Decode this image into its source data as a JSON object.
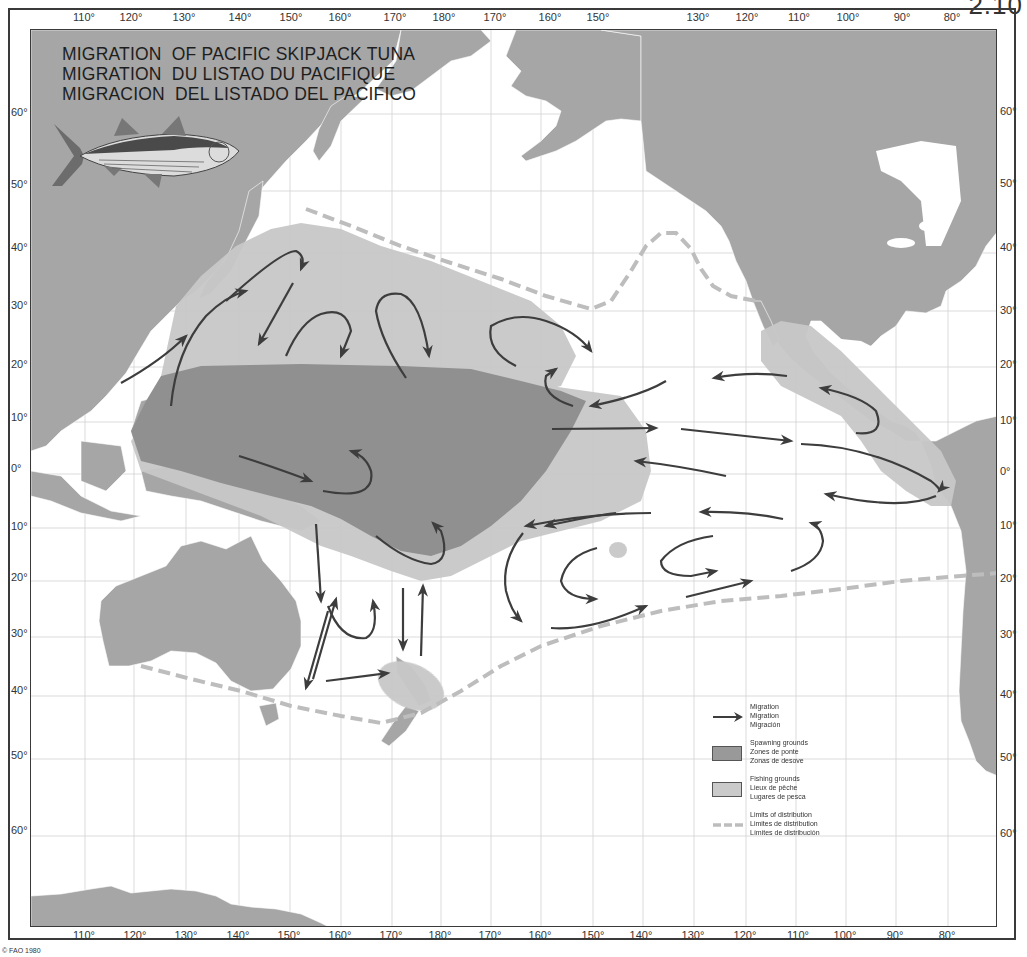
{
  "plate_number": "2.10",
  "title": {
    "lines": [
      "MIGRATION  OF PACIFIC SKIPJACK TUNA",
      "MIGRATION  DU LISTAO DU PACIFIQUE",
      "MIGRACION  DEL LISTADO DEL PACIFICO"
    ]
  },
  "copyright": "© FAO 1980",
  "longitude_labels_top": [
    {
      "label": "110°",
      "x": 84
    },
    {
      "label": "120°",
      "x": 131
    },
    {
      "label": "130°",
      "x": 184
    },
    {
      "label": "140°",
      "x": 240
    },
    {
      "label": "150°",
      "x": 291
    },
    {
      "label": "160°",
      "x": 340
    },
    {
      "label": "170°",
      "x": 395
    },
    {
      "label": "180°",
      "x": 444
    },
    {
      "label": "170°",
      "x": 495
    },
    {
      "label": "160°",
      "x": 550
    },
    {
      "label": "150°",
      "x": 598
    },
    {
      "label": "130°",
      "x": 698
    },
    {
      "label": "120°",
      "x": 747
    },
    {
      "label": "110°",
      "x": 799
    },
    {
      "label": "100°",
      "x": 848
    },
    {
      "label": "90°",
      "x": 902
    },
    {
      "label": "80°",
      "x": 952
    }
  ],
  "longitude_labels_bottom": [
    {
      "label": "110°",
      "x": 84
    },
    {
      "label": "120°",
      "x": 135
    },
    {
      "label": "130°",
      "x": 186
    },
    {
      "label": "140°",
      "x": 238
    },
    {
      "label": "150°",
      "x": 289
    },
    {
      "label": "160°",
      "x": 340
    },
    {
      "label": "170°",
      "x": 391
    },
    {
      "label": "180°",
      "x": 440
    },
    {
      "label": "170°",
      "x": 490
    },
    {
      "label": "160°",
      "x": 540
    },
    {
      "label": "150°",
      "x": 593
    },
    {
      "label": "140°",
      "x": 641
    },
    {
      "label": "130°",
      "x": 693
    },
    {
      "label": "120°",
      "x": 745
    },
    {
      "label": "110°",
      "x": 798
    },
    {
      "label": "100°",
      "x": 845
    },
    {
      "label": "90°",
      "x": 895
    },
    {
      "label": "80°",
      "x": 947
    }
  ],
  "latitude_labels_left": [
    {
      "label": "60°",
      "y": 113
    },
    {
      "label": "50°",
      "y": 185
    },
    {
      "label": "40°",
      "y": 248
    },
    {
      "label": "30°",
      "y": 306
    },
    {
      "label": "20°",
      "y": 365
    },
    {
      "label": "10°",
      "y": 418
    },
    {
      "label": "0°",
      "y": 469
    },
    {
      "label": "10°",
      "y": 527
    },
    {
      "label": "20°",
      "y": 578
    },
    {
      "label": "30°",
      "y": 634
    },
    {
      "label": "40°",
      "y": 691
    },
    {
      "label": "50°",
      "y": 756
    },
    {
      "label": "60°",
      "y": 831
    }
  ],
  "latitude_labels_right": [
    {
      "label": "60°",
      "y": 112
    },
    {
      "label": "50°",
      "y": 184
    },
    {
      "label": "40°",
      "y": 248
    },
    {
      "label": "30°",
      "y": 311
    },
    {
      "label": "20°",
      "y": 365
    },
    {
      "label": "10°",
      "y": 421
    },
    {
      "label": "0°",
      "y": 472
    },
    {
      "label": "10°",
      "y": 526
    },
    {
      "label": "20°",
      "y": 579
    },
    {
      "label": "30°",
      "y": 635
    },
    {
      "label": "40°",
      "y": 695
    },
    {
      "label": "50°",
      "y": 758
    },
    {
      "label": "60°",
      "y": 834
    }
  ],
  "legend": {
    "migration": [
      "Migration",
      "Migration",
      "Migración"
    ],
    "spawning": [
      "Spawning grounds",
      "Zones de ponte",
      "Zonas de desove"
    ],
    "fishing": [
      "Fishing grounds",
      "Lieux de pêche",
      "Lugares de pesca"
    ],
    "limits": [
      "Limits of distribution",
      "Limites de distribution",
      "Límites de distribución"
    ]
  },
  "colors": {
    "land": "#a6a6a6",
    "ocean": "#ffffff",
    "spawning": "#8f8f8f",
    "fishing": "#c6c6c6",
    "arrow": "#3d3d3d",
    "limit_dash": "#bdbdbd",
    "grid": "#cfcfcf"
  },
  "map_features": {
    "fish_icon": "skipjack-tuna-illustration",
    "regions": [
      "spawning-grounds-central-pacific",
      "fishing-grounds-north-pacific",
      "fishing-grounds-eastern-pacific",
      "fishing-grounds-new-zealand"
    ],
    "boundaries": [
      "northern-distribution-limit",
      "southern-distribution-limit"
    ]
  }
}
